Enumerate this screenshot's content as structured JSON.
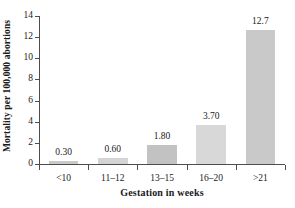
{
  "chart_data": {
    "type": "bar",
    "title": "",
    "xlabel": "Gestation in weeks",
    "ylabel": "Mortality per 100,000 abortions",
    "categories": [
      "<10",
      "11–12",
      "13–15",
      "16–20",
      ">21"
    ],
    "values": [
      0.3,
      0.6,
      1.8,
      3.7,
      12.7
    ],
    "value_labels": [
      "0.30",
      "0.60",
      "1.80",
      "3.70",
      "12.7"
    ],
    "ylim": [
      0,
      14
    ],
    "yticks": [
      0,
      2,
      4,
      6,
      8,
      10,
      12,
      14
    ],
    "ytick_labels": [
      "0",
      "2",
      "4",
      "6",
      "8",
      "10",
      "12",
      "14"
    ],
    "grid": false,
    "legend": "none",
    "bar_colors": [
      "#c9c9c9",
      "#d4d4d4",
      "#c2c2c2",
      "#d8d8d8",
      "#c9c9c9"
    ],
    "axis_color": "#4d4d4d"
  }
}
